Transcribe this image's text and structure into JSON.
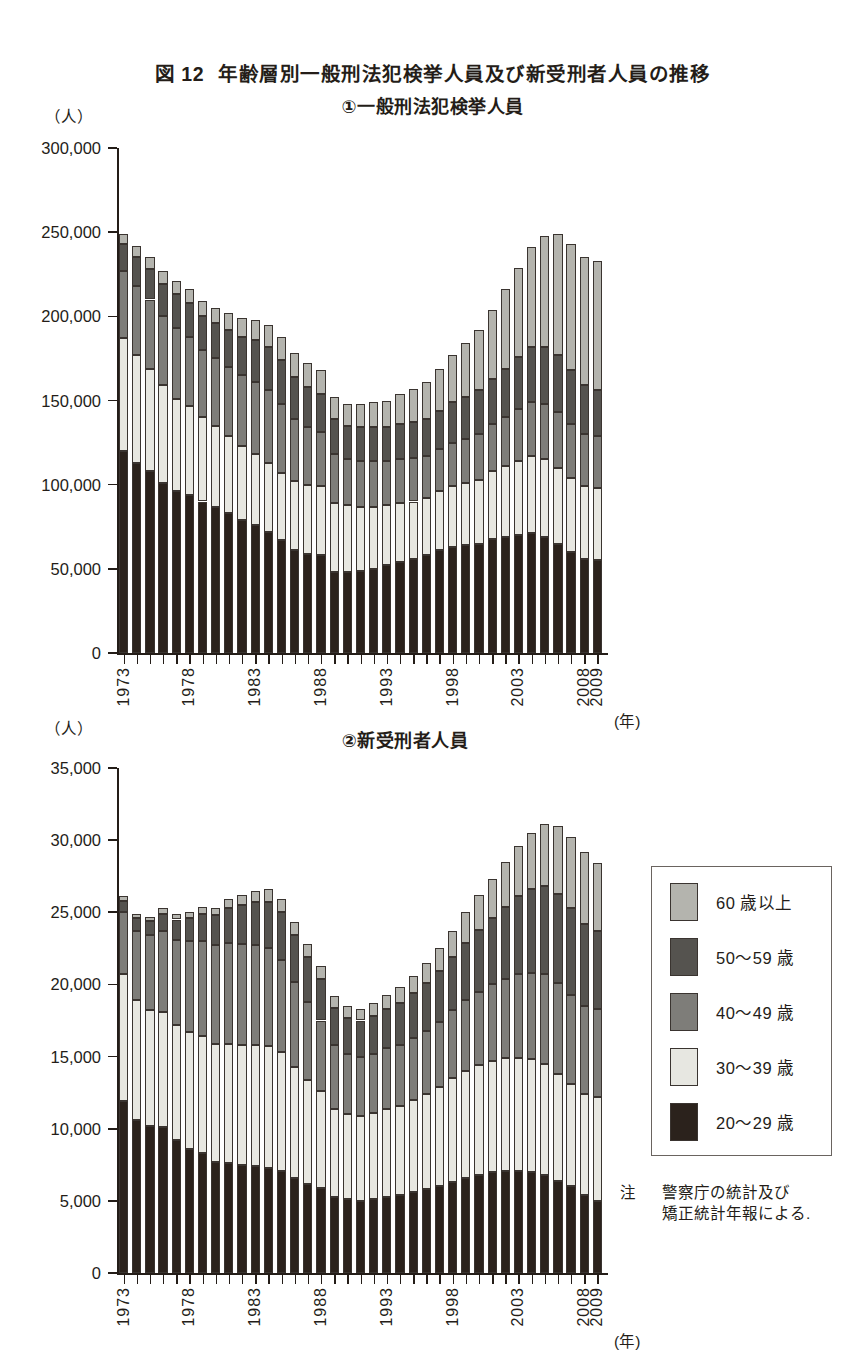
{
  "title": {
    "figure_number": "図 12",
    "text": "年齢層別一般刑法犯検挙人員及び新受刑者人員の推移"
  },
  "panel1": {
    "subtitle": "①一般刑法犯検挙人員",
    "unit": "（人）",
    "x_unit": "(年)"
  },
  "panel2": {
    "subtitle": "②新受刑者人員",
    "unit": "（人）",
    "x_unit": "(年)"
  },
  "legend": {
    "items": [
      {
        "label": "60 歳以上",
        "color": "#b4b4ae"
      },
      {
        "label": "50〜59 歳",
        "color": "#55534f"
      },
      {
        "label": "40〜49 歳",
        "color": "#7e7d79"
      },
      {
        "label": "30〜39 歳",
        "color": "#e7e7e1"
      },
      {
        "label": "20〜29 歳",
        "color": "#2b221c"
      }
    ]
  },
  "note": {
    "label": "注",
    "line1": "警察庁の統計及び",
    "line2": "矯正統計年報による."
  },
  "chart_data": [
    {
      "type": "bar",
      "stacked": true,
      "title": "①一般刑法犯検挙人員",
      "xlabel": "(年)",
      "ylabel": "（人）",
      "ylim": [
        0,
        300000
      ],
      "ytick_step": 50000,
      "yticks": [
        "0",
        "50,000",
        "100,000",
        "150,000",
        "200,000",
        "250,000",
        "300,000"
      ],
      "grid": false,
      "legend_position": "right",
      "categories": [
        1973,
        1974,
        1975,
        1976,
        1977,
        1978,
        1979,
        1980,
        1981,
        1982,
        1983,
        1984,
        1985,
        1986,
        1987,
        1988,
        1989,
        1990,
        1991,
        1992,
        1993,
        1994,
        1995,
        1996,
        1997,
        1998,
        1999,
        2000,
        2001,
        2002,
        2003,
        2004,
        2005,
        2006,
        2007,
        2008,
        2009
      ],
      "xtick_labels": [
        "1973",
        "1978",
        "1983",
        "1988",
        "1993",
        "1998",
        "2003",
        "2008",
        "2009"
      ],
      "series": [
        {
          "name": "20〜29 歳",
          "color": "#2b221c",
          "values": [
            120000,
            113000,
            108000,
            101000,
            96000,
            94000,
            90000,
            87000,
            83000,
            79000,
            76000,
            72000,
            67000,
            61000,
            59000,
            58000,
            48000,
            48000,
            49000,
            50000,
            52000,
            54000,
            56000,
            58000,
            61000,
            63000,
            64000,
            65000,
            68000,
            69000,
            70000,
            71000,
            69000,
            65000,
            60000,
            56000,
            55000
          ]
        },
        {
          "name": "30〜39 歳",
          "color": "#e7e7e1",
          "values": [
            67000,
            64000,
            61000,
            58000,
            55000,
            53000,
            50000,
            48000,
            46000,
            44000,
            42000,
            41000,
            40000,
            41000,
            41000,
            41000,
            41000,
            40000,
            38000,
            37000,
            36000,
            35000,
            34000,
            34000,
            35000,
            36000,
            37000,
            38000,
            40000,
            42000,
            44000,
            46000,
            46000,
            45000,
            44000,
            43000,
            43000
          ]
        },
        {
          "name": "40〜49 歳",
          "color": "#7e7d79",
          "values": [
            40000,
            41000,
            41000,
            41000,
            42000,
            41000,
            40000,
            40000,
            41000,
            42000,
            43000,
            43000,
            41000,
            37000,
            34000,
            32000,
            29000,
            27000,
            27000,
            27000,
            26000,
            26000,
            26000,
            25000,
            25000,
            26000,
            26000,
            27000,
            28000,
            29000,
            31000,
            32000,
            33000,
            33000,
            32000,
            31000,
            31000
          ]
        },
        {
          "name": "50〜59 歳",
          "color": "#55534f",
          "values": [
            16000,
            17000,
            18000,
            19000,
            20000,
            20000,
            20000,
            21000,
            22000,
            23000,
            25000,
            26000,
            26000,
            25000,
            24000,
            23000,
            21000,
            20000,
            20000,
            20000,
            20000,
            21000,
            21000,
            22000,
            23000,
            24000,
            25000,
            26000,
            27000,
            29000,
            31000,
            33000,
            34000,
            34000,
            32000,
            29000,
            27000
          ]
        },
        {
          "name": "60 歳以上",
          "color": "#b4b4ae",
          "values": [
            6000,
            7000,
            7000,
            8000,
            8000,
            8000,
            9000,
            9000,
            10000,
            11000,
            12000,
            13000,
            14000,
            14000,
            14000,
            14000,
            13000,
            13000,
            14000,
            15000,
            16000,
            18000,
            20000,
            22000,
            25000,
            28000,
            32000,
            36000,
            41000,
            47000,
            53000,
            59000,
            66000,
            72000,
            75000,
            76000,
            77000
          ]
        }
      ]
    },
    {
      "type": "bar",
      "stacked": true,
      "title": "②新受刑者人員",
      "xlabel": "(年)",
      "ylabel": "（人）",
      "ylim": [
        0,
        35000
      ],
      "ytick_step": 5000,
      "yticks": [
        "0",
        "5,000",
        "10,000",
        "15,000",
        "20,000",
        "25,000",
        "30,000",
        "35,000"
      ],
      "grid": false,
      "legend_position": "right",
      "categories": [
        1973,
        1974,
        1975,
        1976,
        1977,
        1978,
        1979,
        1980,
        1981,
        1982,
        1983,
        1984,
        1985,
        1986,
        1987,
        1988,
        1989,
        1990,
        1991,
        1992,
        1993,
        1994,
        1995,
        1996,
        1997,
        1998,
        1999,
        2000,
        2001,
        2002,
        2003,
        2004,
        2005,
        2006,
        2007,
        2008,
        2009
      ],
      "xtick_labels": [
        "1973",
        "1978",
        "1983",
        "1988",
        "1993",
        "1998",
        "2003",
        "2008",
        "2009"
      ],
      "series": [
        {
          "name": "20〜29 歳",
          "color": "#2b221c",
          "values": [
            11900,
            10600,
            10200,
            10100,
            9200,
            8600,
            8300,
            7700,
            7600,
            7500,
            7400,
            7300,
            7100,
            6600,
            6200,
            5900,
            5300,
            5100,
            5000,
            5100,
            5300,
            5400,
            5600,
            5800,
            6000,
            6300,
            6600,
            6800,
            7000,
            7100,
            7100,
            7000,
            6800,
            6400,
            6000,
            5400,
            5000
          ]
        },
        {
          "name": "30〜39 歳",
          "color": "#e7e7e1",
          "values": [
            8800,
            8300,
            8000,
            8000,
            8000,
            8100,
            8100,
            8200,
            8300,
            8300,
            8400,
            8400,
            8200,
            7700,
            7200,
            6700,
            6100,
            5900,
            5900,
            6000,
            6100,
            6200,
            6400,
            6600,
            6900,
            7200,
            7400,
            7600,
            7700,
            7800,
            7800,
            7800,
            7700,
            7400,
            7100,
            7000,
            7200
          ]
        },
        {
          "name": "40〜49 歳",
          "color": "#7e7d79",
          "values": [
            4300,
            4800,
            5200,
            5600,
            5900,
            6300,
            6600,
            6800,
            7000,
            7000,
            6900,
            6800,
            6400,
            5900,
            5400,
            4900,
            4400,
            4200,
            4100,
            4100,
            4200,
            4200,
            4300,
            4400,
            4500,
            4700,
            4900,
            5100,
            5300,
            5500,
            5800,
            6000,
            6200,
            6300,
            6200,
            6100,
            6100
          ]
        },
        {
          "name": "50〜59 歳",
          "color": "#55534f",
          "values": [
            800,
            900,
            1000,
            1200,
            1400,
            1600,
            1900,
            2100,
            2400,
            2700,
            3000,
            3200,
            3300,
            3200,
            3100,
            2900,
            2600,
            2500,
            2500,
            2600,
            2700,
            2900,
            3100,
            3300,
            3500,
            3700,
            4000,
            4300,
            4600,
            5000,
            5400,
            5800,
            6100,
            6200,
            6000,
            5700,
            5400
          ]
        },
        {
          "name": "60 歳以上",
          "color": "#b4b4ae",
          "values": [
            300,
            300,
            300,
            400,
            400,
            400,
            500,
            500,
            600,
            700,
            800,
            900,
            900,
            900,
            900,
            900,
            800,
            800,
            800,
            900,
            1000,
            1100,
            1200,
            1400,
            1600,
            1800,
            2100,
            2400,
            2700,
            3100,
            3500,
            3900,
            4300,
            4700,
            4900,
            5000,
            4700
          ]
        }
      ]
    }
  ]
}
